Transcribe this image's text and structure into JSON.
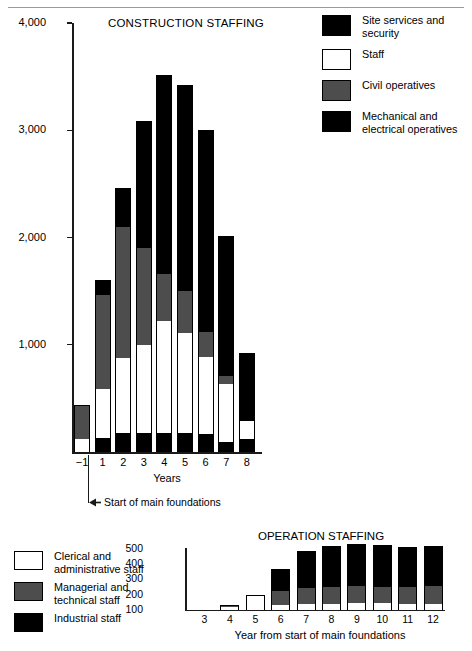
{
  "chart_data": [
    {
      "type": "bar",
      "subtype": "stacked",
      "title": "CONSTRUCTION STAFFING",
      "xlabel": "Years",
      "ylabel": "",
      "ylim": [
        0,
        4000
      ],
      "ytick_labels": [
        "4,000",
        "3,000",
        "2,000",
        "1,000"
      ],
      "yticks": [
        4000,
        3000,
        2000,
        1000
      ],
      "categories": [
        "−1",
        "1",
        "2",
        "3",
        "4",
        "5",
        "6",
        "7",
        "8"
      ],
      "grid": false,
      "legend_position": "top-right",
      "annotation": "Start of main foundations",
      "series": [
        {
          "name": "Mechanical and electrical operatives",
          "color": "#000000",
          "values": [
            0,
            130,
            180,
            180,
            180,
            180,
            170,
            90,
            120
          ]
        },
        {
          "name": "Staff",
          "color": "#ffffff",
          "values": [
            120,
            460,
            700,
            820,
            1040,
            930,
            720,
            540,
            170
          ]
        },
        {
          "name": "Civil operatives",
          "color": "#4d4d4d",
          "values": [
            320,
            870,
            1220,
            900,
            440,
            390,
            230,
            80,
            0
          ]
        },
        {
          "name": "Site services and security",
          "color": "#000000",
          "values": [
            0,
            140,
            360,
            1190,
            1860,
            1920,
            1880,
            1300,
            630
          ]
        }
      ],
      "totals": [
        440,
        1600,
        2460,
        3090,
        3520,
        3420,
        3000,
        2010,
        920
      ]
    },
    {
      "type": "bar",
      "subtype": "stacked",
      "title": "OPERATION STAFFING",
      "xlabel": "Year from start of main foundations",
      "ylabel": "",
      "ylim": [
        100,
        500
      ],
      "ytick_labels": [
        "500",
        "400",
        "300",
        "200",
        "100"
      ],
      "yticks": [
        500,
        400,
        300,
        200,
        100
      ],
      "categories": [
        "3",
        "4",
        "5",
        "6",
        "7",
        "8",
        "9",
        "10",
        "11",
        "12"
      ],
      "grid": false,
      "legend_position": "left",
      "series": [
        {
          "name": "Clerical and administrative staff",
          "color": "#ffffff",
          "values": [
            0,
            20,
            95,
            35,
            40,
            40,
            45,
            45,
            40,
            40
          ]
        },
        {
          "name": "Managerial and technical staff",
          "color": "#4d4d4d",
          "values": [
            0,
            5,
            0,
            90,
            105,
            110,
            110,
            105,
            110,
            115
          ]
        },
        {
          "name": "Industrial staff",
          "color": "#000000",
          "values": [
            0,
            5,
            0,
            140,
            240,
            265,
            275,
            275,
            260,
            260
          ]
        }
      ],
      "totals": [
        100,
        130,
        195,
        365,
        485,
        515,
        530,
        525,
        510,
        515
      ]
    }
  ],
  "construction": {
    "title": "CONSTRUCTION STAFFING",
    "y_ticks": [
      {
        "label": "4,000",
        "value": 4000
      },
      {
        "label": "3,000",
        "value": 3000
      },
      {
        "label": "2,000",
        "value": 2000
      },
      {
        "label": "1,000",
        "value": 1000
      }
    ],
    "x_axis_title": "Years",
    "x_labels": [
      "−1",
      "1",
      "2",
      "3",
      "4",
      "5",
      "6",
      "7",
      "8"
    ],
    "annotation": "Start of main foundations",
    "legend": [
      {
        "label": "Site services and security",
        "swatch": "black"
      },
      {
        "label": "Staff",
        "swatch": "white"
      },
      {
        "label": "Civil operatives",
        "swatch": "gray"
      },
      {
        "label": "Mechanical and electrical operatives",
        "swatch": "black"
      }
    ],
    "bars": [
      {
        "category": "−1",
        "mech": 0,
        "staff": 120,
        "civil": 320,
        "site": 0,
        "total": 440
      },
      {
        "category": "1",
        "mech": 130,
        "staff": 460,
        "civil": 870,
        "site": 140,
        "total": 1600
      },
      {
        "category": "2",
        "mech": 180,
        "staff": 700,
        "civil": 1220,
        "site": 360,
        "total": 2460
      },
      {
        "category": "3",
        "mech": 180,
        "staff": 820,
        "civil": 900,
        "site": 1190,
        "total": 3090
      },
      {
        "category": "4",
        "mech": 180,
        "staff": 1040,
        "civil": 440,
        "site": 1860,
        "total": 3520
      },
      {
        "category": "5",
        "mech": 180,
        "staff": 930,
        "civil": 390,
        "site": 1920,
        "total": 3420
      },
      {
        "category": "6",
        "mech": 170,
        "staff": 720,
        "civil": 230,
        "site": 1880,
        "total": 3000
      },
      {
        "category": "7",
        "mech": 90,
        "staff": 540,
        "civil": 80,
        "site": 1300,
        "total": 2010
      },
      {
        "category": "8",
        "mech": 120,
        "staff": 170,
        "civil": 0,
        "site": 630,
        "total": 920
      }
    ]
  },
  "operation": {
    "title": "OPERATION STAFFING",
    "y_ticks": [
      {
        "label": "500",
        "value": 500
      },
      {
        "label": "400",
        "value": 400
      },
      {
        "label": "300",
        "value": 300
      },
      {
        "label": "200",
        "value": 200
      },
      {
        "label": "100",
        "value": 100
      }
    ],
    "x_axis_title": "Year from start of main foundations",
    "x_labels": [
      "3",
      "4",
      "5",
      "6",
      "7",
      "8",
      "9",
      "10",
      "11",
      "12"
    ],
    "legend": [
      {
        "label": "Clerical and administrative staff",
        "swatch": "white"
      },
      {
        "label": "Managerial and technical staff",
        "swatch": "gray"
      },
      {
        "label": "Industrial staff",
        "swatch": "black"
      }
    ],
    "bars": [
      {
        "category": "3",
        "cler": 0,
        "mgr": 0,
        "ind": 0,
        "total": 100
      },
      {
        "category": "4",
        "cler": 20,
        "mgr": 5,
        "ind": 5,
        "total": 130
      },
      {
        "category": "5",
        "cler": 95,
        "mgr": 0,
        "ind": 0,
        "total": 195
      },
      {
        "category": "6",
        "cler": 35,
        "mgr": 90,
        "ind": 140,
        "total": 365
      },
      {
        "category": "7",
        "cler": 40,
        "mgr": 105,
        "ind": 240,
        "total": 485
      },
      {
        "category": "8",
        "cler": 40,
        "mgr": 110,
        "ind": 265,
        "total": 515
      },
      {
        "category": "9",
        "cler": 45,
        "mgr": 110,
        "ind": 275,
        "total": 530
      },
      {
        "category": "10",
        "cler": 45,
        "mgr": 105,
        "ind": 275,
        "total": 525
      },
      {
        "category": "11",
        "cler": 40,
        "mgr": 110,
        "ind": 260,
        "total": 510
      },
      {
        "category": "12",
        "cler": 40,
        "mgr": 115,
        "ind": 260,
        "total": 515
      }
    ]
  },
  "colors": {
    "black": "#000000",
    "gray": "#4d4d4d",
    "white": "#ffffff",
    "axis": "#1a1a1a",
    "rule": "#9a9a9a"
  }
}
